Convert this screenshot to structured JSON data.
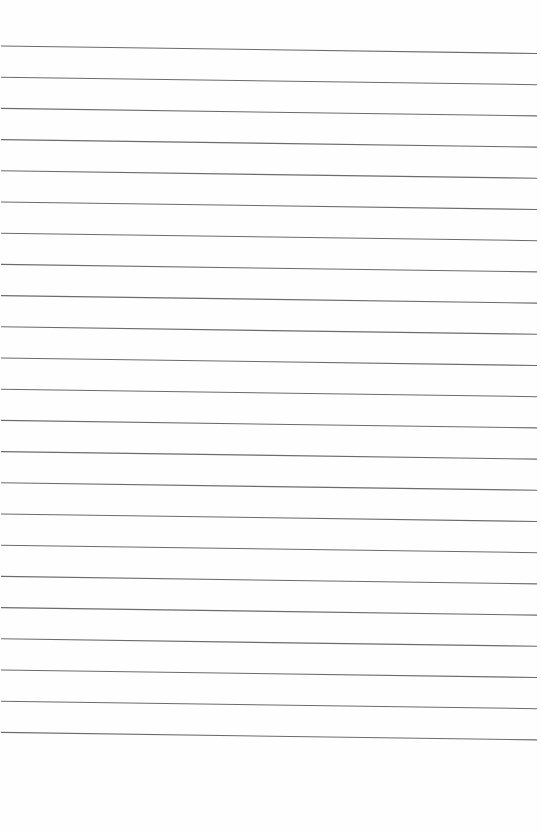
{
  "page": {
    "type": "lined-paper",
    "background_color": "#fefefe",
    "line_color": "#6b6b6b",
    "line_count": 23,
    "line_spacing_px": 31.2,
    "first_line_y_left": 46,
    "first_line_y_right": 53.5,
    "line_x_start": 1,
    "line_x_end": 537,
    "line_width_px": 1.1
  }
}
